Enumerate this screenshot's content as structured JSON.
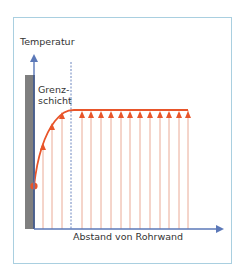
{
  "diagram": {
    "type": "temperature-boundary-layer-profile",
    "y_axis_label": "Temperatur",
    "x_axis_label": "Abstand von Rohrwand",
    "boundary_layer_label_line1": "Grenz-",
    "boundary_layer_label_line2": "schicht",
    "colors": {
      "frame": "#a9cfe0",
      "axis": "#5b78b8",
      "wall": "#7f7f7f",
      "wall_edge": "#111111",
      "profile": "#e8552a",
      "arrow_lines": "#e8a08a",
      "dashed_line": "#5b78b8"
    },
    "profile": {
      "wall_point": {
        "x": 34,
        "y": 186
      },
      "curve_points": [
        [
          34,
          186
        ],
        [
          43,
          146
        ],
        [
          52,
          126
        ],
        [
          62,
          115
        ],
        [
          72,
          110
        ]
      ],
      "plateau_y": 110,
      "plateau_end_x": 188,
      "arrow_x_positions_boundary": [
        43,
        52,
        62
      ],
      "arrow_x_positions_core": [
        82,
        91,
        101,
        111,
        121,
        130,
        140,
        150,
        160,
        169,
        179,
        188
      ]
    }
  }
}
